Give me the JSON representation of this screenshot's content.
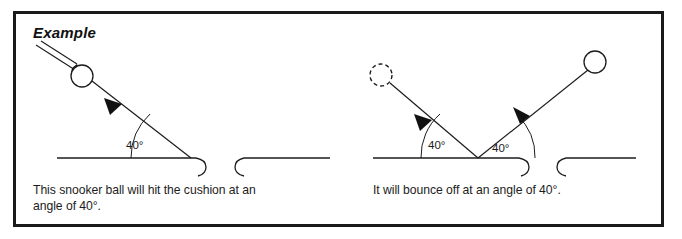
{
  "page": {
    "width": 682,
    "height": 239,
    "background_color": "#ffffff",
    "border_color": "#1a1a1a",
    "ink_color": "#1c1c1c"
  },
  "example_label": {
    "text": "Example",
    "style": "bold-italic"
  },
  "panels": {
    "left": {
      "caption": "This snooker ball will hit the cushion at an angle of 40°.",
      "angle_label": "40°",
      "ball_style": "solid-outline-circle",
      "arrow_direction": "down-right-toward-cushion"
    },
    "right": {
      "caption": "It will bounce off at an angle of 40°.",
      "angle_label_incoming": "40°",
      "angle_label_outgoing": "40°",
      "incoming_ball_style": "dashed-outline-circle",
      "outgoing_ball_style": "solid-outline-circle",
      "arrow_direction_incoming": "down-right-toward-cushion",
      "arrow_direction_outgoing": "up-right-away-from-cushion"
    }
  },
  "cushion": {
    "label": "snooker table cushion with pocket gap",
    "pocket_count_per_panel": 1
  }
}
